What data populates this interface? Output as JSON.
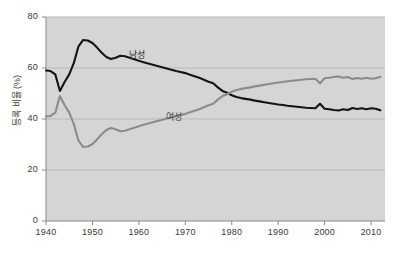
{
  "chart_data": {
    "type": "line",
    "title": "",
    "subtitle": "",
    "xlabel": "",
    "ylabel": "등록 비율 (%)",
    "xlim": [
      1940,
      2013
    ],
    "ylim": [
      0,
      80
    ],
    "grid": true,
    "grid_axis": "y",
    "legend_position": "inline-annotation",
    "x_ticks": [
      1940,
      1950,
      1960,
      1970,
      1980,
      1990,
      2000,
      2010
    ],
    "x_tick_labels": [
      "1940",
      "1950",
      "1960",
      "1970",
      "1980",
      "1990",
      "2000",
      "2010"
    ],
    "y_ticks": [
      0,
      20,
      40,
      60,
      80
    ],
    "y_tick_labels": [
      "0",
      "20",
      "40",
      "60",
      "80"
    ],
    "plot_background": "#d5d5d5",
    "series": [
      {
        "name": "남성",
        "color": "#141414",
        "label_x": 1960,
        "label_y": 65.5,
        "x": [
          1940,
          1941,
          1942,
          1943,
          1944,
          1945,
          1946,
          1947,
          1948,
          1949,
          1950,
          1951,
          1952,
          1953,
          1954,
          1955,
          1956,
          1957,
          1958,
          1959,
          1960,
          1961,
          1962,
          1963,
          1964,
          1965,
          1966,
          1967,
          1968,
          1969,
          1970,
          1971,
          1972,
          1973,
          1974,
          1975,
          1976,
          1977,
          1978,
          1979,
          1980,
          1981,
          1982,
          1983,
          1984,
          1985,
          1986,
          1987,
          1988,
          1989,
          1990,
          1991,
          1992,
          1993,
          1994,
          1995,
          1996,
          1997,
          1998,
          1999,
          2000,
          2001,
          2002,
          2003,
          2004,
          2005,
          2006,
          2007,
          2008,
          2009,
          2010,
          2011,
          2012
        ],
        "values": [
          59.0,
          58.8,
          57.5,
          51.0,
          54.5,
          57.5,
          62.0,
          68.5,
          71.0,
          70.8,
          69.8,
          68.0,
          66.0,
          64.3,
          63.5,
          64.0,
          64.8,
          64.6,
          64.0,
          63.4,
          62.8,
          62.3,
          61.8,
          61.3,
          60.8,
          60.3,
          59.8,
          59.3,
          58.8,
          58.4,
          58.0,
          57.4,
          56.8,
          56.2,
          55.4,
          54.6,
          54.0,
          52.4,
          51.0,
          50.3,
          49.3,
          48.6,
          48.2,
          47.9,
          47.6,
          47.2,
          46.9,
          46.6,
          46.3,
          46.0,
          45.7,
          45.5,
          45.2,
          45.0,
          44.8,
          44.6,
          44.4,
          44.3,
          44.2,
          46.0,
          44.0,
          43.8,
          43.5,
          43.3,
          43.8,
          43.5,
          44.3,
          43.9,
          44.2,
          43.8,
          44.2,
          44.0,
          43.4
        ]
      },
      {
        "name": "여성",
        "color": "#8c8c8c",
        "label_x": 1968,
        "label_y": 41.0,
        "x": [
          1940,
          1941,
          1942,
          1943,
          1944,
          1945,
          1946,
          1947,
          1948,
          1949,
          1950,
          1951,
          1952,
          1953,
          1954,
          1955,
          1956,
          1957,
          1958,
          1959,
          1960,
          1961,
          1962,
          1963,
          1964,
          1965,
          1966,
          1967,
          1968,
          1969,
          1970,
          1971,
          1972,
          1973,
          1974,
          1975,
          1976,
          1977,
          1978,
          1979,
          1980,
          1981,
          1982,
          1983,
          1984,
          1985,
          1986,
          1987,
          1988,
          1989,
          1990,
          1991,
          1992,
          1993,
          1994,
          1995,
          1996,
          1997,
          1998,
          1999,
          2000,
          2001,
          2002,
          2003,
          2004,
          2005,
          2006,
          2007,
          2008,
          2009,
          2010,
          2011,
          2012
        ],
        "values": [
          41.0,
          41.2,
          42.5,
          49.0,
          45.5,
          42.5,
          38.0,
          31.5,
          29.0,
          29.2,
          30.2,
          32.0,
          34.0,
          35.7,
          36.5,
          36.0,
          35.2,
          35.4,
          36.0,
          36.6,
          37.2,
          37.7,
          38.2,
          38.7,
          39.2,
          39.7,
          40.2,
          40.7,
          41.2,
          41.6,
          42.0,
          42.6,
          43.2,
          43.8,
          44.6,
          45.4,
          46.0,
          47.6,
          49.0,
          49.7,
          50.7,
          51.4,
          51.8,
          52.1,
          52.4,
          52.8,
          53.1,
          53.4,
          53.7,
          54.0,
          54.3,
          54.5,
          54.8,
          55.0,
          55.2,
          55.4,
          55.6,
          55.7,
          55.8,
          54.0,
          56.0,
          56.2,
          56.5,
          56.7,
          56.2,
          56.5,
          55.7,
          56.1,
          55.8,
          56.2,
          55.8,
          56.0,
          56.6
        ]
      }
    ]
  }
}
